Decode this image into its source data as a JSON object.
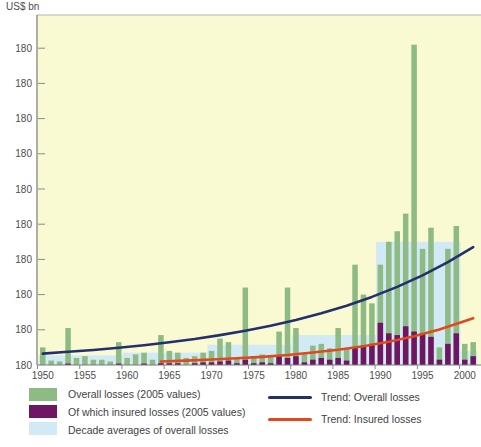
{
  "chart_data": {
    "type": "bar",
    "title": "",
    "xlabel": "",
    "ylabel": "US$ bn",
    "ylim": [
      0,
      199
    ],
    "grid": false,
    "colors": {
      "plot_background": "#FAFAD2",
      "overall_bar": "#8EBA84",
      "insured_bar": "#6F1563",
      "decade_average": "#D2EAF5",
      "trend_overall": "#24306E",
      "trend_insured": "#E2481E",
      "axis": "#7a7a7a",
      "tick_text": "#4d4d4d"
    },
    "y_axis": {
      "tick_values": [
        0,
        20,
        40,
        60,
        80,
        100,
        120,
        140,
        160,
        180
      ],
      "tick_labels": [
        "180",
        "180",
        "180",
        "180",
        "180",
        "180",
        "180",
        "180",
        "180",
        "180"
      ]
    },
    "x_axis": {
      "tick_years": [
        1950,
        1955,
        1960,
        1965,
        1970,
        1975,
        1980,
        1985,
        1990,
        1995,
        2000
      ]
    },
    "years": [
      1950,
      1951,
      1952,
      1953,
      1954,
      1955,
      1956,
      1957,
      1958,
      1959,
      1960,
      1961,
      1962,
      1963,
      1964,
      1965,
      1966,
      1967,
      1968,
      1969,
      1970,
      1971,
      1972,
      1973,
      1974,
      1975,
      1976,
      1977,
      1978,
      1979,
      1980,
      1981,
      1982,
      1983,
      1984,
      1985,
      1986,
      1987,
      1988,
      1989,
      1990,
      1991,
      1992,
      1993,
      1994,
      1995,
      1996,
      1997,
      1998,
      1999,
      2000,
      2001
    ],
    "series": [
      {
        "name": "Overall losses (2005 values)",
        "color": "#8EBA84",
        "values": [
          10,
          2.5,
          2,
          21,
          4,
          5,
          3,
          3,
          2,
          13,
          4,
          6,
          7,
          3,
          17,
          8,
          7,
          4,
          5,
          7,
          8,
          15,
          13,
          4,
          44,
          5,
          6,
          4.5,
          19,
          44,
          21,
          6.5,
          11,
          12,
          9.5,
          21,
          9,
          57,
          40,
          35,
          57,
          70,
          76,
          86,
          182,
          66,
          78,
          10,
          66,
          79,
          12,
          13
        ]
      },
      {
        "name": "Of which insured losses (2005 values)",
        "color": "#6F1563",
        "values": [
          0.3,
          0.2,
          0.2,
          0.8,
          0.3,
          0.5,
          0.3,
          0.3,
          0.2,
          0.8,
          0.4,
          0.5,
          0.8,
          0.3,
          1,
          1,
          1,
          0.5,
          1,
          1.5,
          1.5,
          2,
          2.5,
          1,
          3,
          1,
          1.5,
          1,
          5,
          4,
          5,
          1.5,
          3,
          4,
          3,
          4,
          2.5,
          10,
          11,
          12,
          24,
          18,
          17,
          22,
          19,
          18,
          16,
          3,
          12,
          18,
          3,
          5
        ]
      }
    ],
    "decade_averages": {
      "name": "Decade averages of overall losses",
      "color": "#D2EAF5",
      "decades": [
        {
          "start": 1950,
          "end": 1959,
          "value": 5.5
        },
        {
          "start": 1960,
          "end": 1969,
          "value": 7
        },
        {
          "start": 1970,
          "end": 1979,
          "value": 11.5
        },
        {
          "start": 1980,
          "end": 1989,
          "value": 17
        },
        {
          "start": 1990,
          "end": 1999,
          "value": 70
        },
        {
          "start": 2000,
          "end": 2001,
          "value": 8
        }
      ]
    },
    "trends": [
      {
        "name": "Trend: Overall losses",
        "color": "#24306E",
        "points": [
          [
            1950,
            6.5
          ],
          [
            1953,
            7.5
          ],
          [
            1956,
            8.5
          ],
          [
            1959,
            9.8
          ],
          [
            1962,
            11.2
          ],
          [
            1965,
            12.9
          ],
          [
            1968,
            14.8
          ],
          [
            1971,
            17
          ],
          [
            1974,
            19.5
          ],
          [
            1977,
            22.3
          ],
          [
            1980,
            25.6
          ],
          [
            1983,
            29.4
          ],
          [
            1986,
            33.7
          ],
          [
            1989,
            38.7
          ],
          [
            1992,
            44.4
          ],
          [
            1995,
            50.9
          ],
          [
            1998,
            58.4
          ],
          [
            2001,
            67
          ]
        ]
      },
      {
        "name": "Trend: Insured losses",
        "color": "#E2481E",
        "points": [
          [
            1964,
            2
          ],
          [
            1967,
            2.5
          ],
          [
            1970,
            3.1
          ],
          [
            1973,
            3.8
          ],
          [
            1976,
            4.6
          ],
          [
            1979,
            5.7
          ],
          [
            1982,
            7.1
          ],
          [
            1985,
            8.7
          ],
          [
            1988,
            10.7
          ],
          [
            1991,
            13.2
          ],
          [
            1994,
            16.3
          ],
          [
            1997,
            20.1
          ],
          [
            2001,
            26.6
          ]
        ]
      }
    ],
    "legend_position": "bottom"
  },
  "legend": {
    "items": [
      {
        "label": "Overall losses (2005 values)"
      },
      {
        "label": "Of which insured losses (2005 values)"
      },
      {
        "label": "Decade averages of overall losses"
      },
      {
        "label": "Trend: Overall losses"
      },
      {
        "label": "Trend: Insured losses"
      }
    ]
  }
}
